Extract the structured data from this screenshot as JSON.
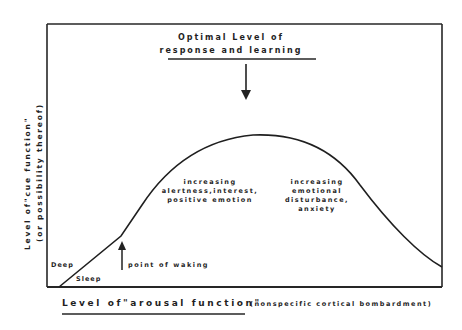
{
  "figure": {
    "top_annotation": {
      "line1": "Optimal Level of",
      "line2": "response and learning"
    },
    "y_axis": {
      "line1": "Level of\"cue function\"",
      "line2": "(or possibility thereof)"
    },
    "x_axis": {
      "label": "Level of\"arousal function\"",
      "sublabel": "(nonspecific cortical bombardment)"
    },
    "annotations": {
      "deep": "Deep",
      "sleep": "Sleep",
      "waking": "point of waking",
      "left_region": {
        "line1": "increasing",
        "line2": "alertness,interest,",
        "line3": "positive emotion"
      },
      "right_region": {
        "line1": "increasing",
        "line2": "emotional",
        "line3": "disturbance,",
        "line4": "anxiety"
      }
    },
    "colors": {
      "ink": "#1f1f1f",
      "background": "#ffffff"
    }
  }
}
